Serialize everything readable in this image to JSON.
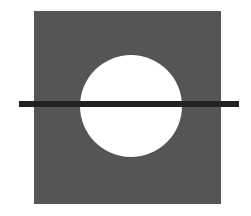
{
  "diagram": {
    "background": "#ffffff",
    "square": {
      "x": 34,
      "y": 11,
      "width": 187,
      "height": 193,
      "fill": "#555555"
    },
    "circle": {
      "cx": 131,
      "cy": 106,
      "r": 51,
      "fill": "#ffffff"
    },
    "line": {
      "x1": 19,
      "x2": 239,
      "y": 104,
      "thickness": 6,
      "color": "#222222"
    }
  }
}
